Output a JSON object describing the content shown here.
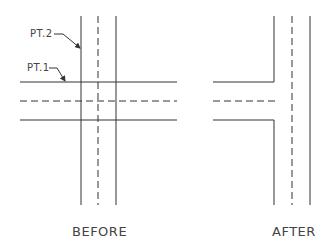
{
  "diagram": {
    "labels": {
      "pt2": "PT.2",
      "pt1": "PT.1",
      "before": "BEFORE",
      "after": "AFTER"
    },
    "colors": {
      "line": "#333333",
      "text": "#444444"
    },
    "before": {
      "horizontal_lines": [
        {
          "y": 82,
          "x1": 20,
          "x2": 177,
          "style": "solid"
        },
        {
          "y": 101,
          "x1": 20,
          "x2": 177,
          "style": "dashed"
        },
        {
          "y": 120,
          "x1": 20,
          "x2": 177,
          "style": "solid"
        }
      ],
      "vertical_lines": [
        {
          "x": 81,
          "y1": 16,
          "y2": 205,
          "style": "solid"
        },
        {
          "x": 98,
          "y1": 16,
          "y2": 205,
          "style": "dashed"
        },
        {
          "x": 116,
          "y1": 16,
          "y2": 205,
          "style": "solid"
        }
      ]
    },
    "after": {
      "corner_lines": [
        {
          "desc": "upper-left corner",
          "points": "213,82 274,82 274,16"
        },
        {
          "desc": "lower-left corner",
          "points": "213,120 274,120 274,205"
        }
      ],
      "dashed_horizontal": {
        "y": 101,
        "x1": 213,
        "x2": 277
      },
      "vertical_lines": [
        {
          "x": 292,
          "y1": 16,
          "y2": 205,
          "style": "dashed"
        },
        {
          "x": 310,
          "y1": 16,
          "y2": 205,
          "style": "solid"
        }
      ]
    }
  }
}
